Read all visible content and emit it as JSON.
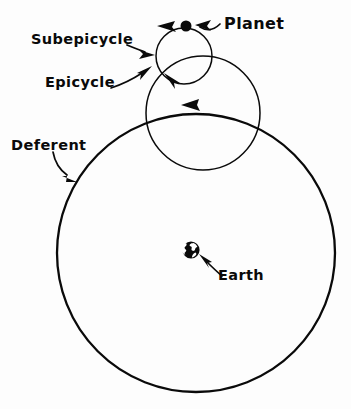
{
  "diagram": {
    "background_color": "#fdfdfd",
    "ink_color": "#0a0a0a",
    "style": "hand-drawn line diagram",
    "width": 351,
    "height": 409
  },
  "labels": {
    "planet": "Planet",
    "subepicycle": "Subepicycle",
    "epicycle": "Epicycle",
    "deferent": "Deferent",
    "earth": "Earth"
  },
  "bodies": [
    {
      "name": "planet",
      "label": "Planet",
      "shape": "filled-dot",
      "center_x": 186,
      "center_y": 26,
      "radius": 5.5,
      "color": "#0a0a0a"
    },
    {
      "name": "earth",
      "label": "Earth",
      "shape": "globe",
      "center_x": 191,
      "center_y": 250,
      "radius": 8.5,
      "color": "#0a0a0a"
    }
  ],
  "orbits": [
    {
      "name": "deferent",
      "label": "Deferent",
      "center_x": 196,
      "center_y": 253,
      "radius": 139,
      "stroke_width": 2.3,
      "direction": "counter-clockwise",
      "arrow_at_degrees": 272
    },
    {
      "name": "epicycle",
      "label": "Epicycle",
      "center_x": 203,
      "center_y": 113,
      "radius": 57,
      "stroke_width": 1.5,
      "direction": "counter-clockwise",
      "arrow_at_degrees": 228
    },
    {
      "name": "subepicycle",
      "label": "Subepicycle",
      "center_x": 184,
      "center_y": 56,
      "radius": 28,
      "stroke_width": 1.5,
      "direction": "counter-clockwise",
      "arrow_at_degrees": 250
    }
  ],
  "leaders": [
    {
      "name": "planet-leader",
      "from_label": "Planet",
      "points_to": "planet",
      "arrow_direction": "left"
    },
    {
      "name": "subepicycle-leader",
      "from_label": "Subepicycle",
      "points_to": "subepicycle",
      "arrow_direction": "right"
    },
    {
      "name": "epicycle-leader",
      "from_label": "Epicycle",
      "points_to": "epicycle",
      "arrow_direction": "up-right"
    },
    {
      "name": "deferent-leader",
      "from_label": "Deferent",
      "points_to": "deferent",
      "arrow_direction": "down-right"
    },
    {
      "name": "earth-leader",
      "from_label": "Earth",
      "points_to": "earth",
      "arrow_direction": "up-left"
    }
  ]
}
